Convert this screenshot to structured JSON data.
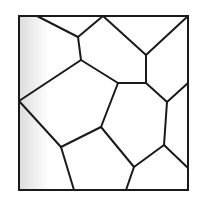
{
  "diagram": {
    "type": "voronoi-tessellation",
    "stroke_color": "#1a1a1a",
    "background_color": "#ffffff",
    "shade_color": "#e6e6e6",
    "frame": {
      "x": 19,
      "y": 16,
      "width": 169,
      "height": 174
    },
    "vertices": {
      "A": [
        37,
        16
      ],
      "B": [
        103,
        16
      ],
      "C": [
        188,
        16
      ],
      "D": [
        78,
        37
      ],
      "E": [
        81,
        60
      ],
      "F": [
        146,
        55
      ],
      "G": [
        146,
        83
      ],
      "H": [
        118,
        83
      ],
      "I": [
        19,
        101
      ],
      "J": [
        167,
        102
      ],
      "K": [
        188,
        83
      ],
      "L": [
        101,
        127
      ],
      "M": [
        61,
        147
      ],
      "N": [
        134,
        167
      ],
      "O": [
        164,
        145
      ],
      "P": [
        188,
        168
      ],
      "Q": [
        74,
        190
      ],
      "R": [
        126,
        190
      ]
    },
    "edges": [
      [
        "A",
        "D"
      ],
      [
        "D",
        "B"
      ],
      [
        "D",
        "E"
      ],
      [
        "B",
        "F"
      ],
      [
        "F",
        "C"
      ],
      [
        "F",
        "G"
      ],
      [
        "G",
        "H"
      ],
      [
        "H",
        "E"
      ],
      [
        "E",
        "I"
      ],
      [
        "G",
        "J"
      ],
      [
        "J",
        "K"
      ],
      [
        "J",
        "O"
      ],
      [
        "H",
        "L"
      ],
      [
        "L",
        "M"
      ],
      [
        "I",
        "M"
      ],
      [
        "M",
        "Q"
      ],
      [
        "L",
        "N"
      ],
      [
        "N",
        "R"
      ],
      [
        "N",
        "O"
      ],
      [
        "O",
        "P"
      ]
    ]
  }
}
